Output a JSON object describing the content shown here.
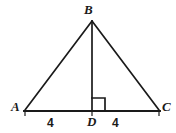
{
  "figure": {
    "kind": "geometry-diagram",
    "shape": "isosceles-triangle-with-altitude",
    "stroke_color": "#1a1a1a",
    "background_color": "#ffffff",
    "vertices": {
      "apex": "B",
      "base_left": "A",
      "base_right": "C",
      "foot_of_altitude": "D"
    },
    "segment_labels": {
      "left": "4",
      "right": "4"
    },
    "right_angle_at": "D"
  }
}
